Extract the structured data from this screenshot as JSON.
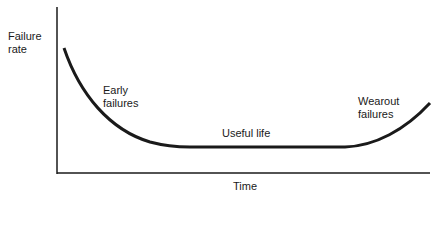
{
  "diagram": {
    "y_axis_label_line1": "Failure",
    "y_axis_label_line2": "rate",
    "x_axis_label": "Time",
    "regions": [
      {
        "label_line1": "Early",
        "label_line2": "failures"
      },
      {
        "label_line1": "Useful life",
        "label_line2": ""
      },
      {
        "label_line1": "Wearout",
        "label_line2": "failures"
      }
    ],
    "curve_color": "#1a1a1a"
  }
}
